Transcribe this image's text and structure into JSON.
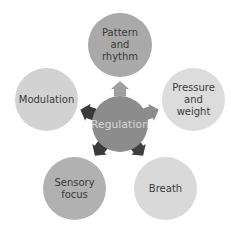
{
  "diagram": {
    "type": "radial-cycle",
    "center": {
      "label": "Regulation",
      "color": "#8c8c8c",
      "text_color": "#d8d8d8"
    },
    "nodes": [
      {
        "id": "pattern",
        "label": "Pattern and\nrhythm",
        "color": "#a9a9a9"
      },
      {
        "id": "pressure",
        "label": "Pressure\nand\nweight",
        "color": "#dcdcdc"
      },
      {
        "id": "breath",
        "label": "Breath",
        "color": "#d9d9d9"
      },
      {
        "id": "sensory",
        "label": "Sensory\nfocus",
        "color": "#b1b1b1"
      },
      {
        "id": "modulation",
        "label": "Modulation",
        "color": "#d2d2d2"
      }
    ],
    "arrows": [
      {
        "to": "pattern",
        "color": "#a0a0a0"
      },
      {
        "to": "pressure",
        "color": "#8c8c8c"
      },
      {
        "to": "breath",
        "color": "#3f3f3f"
      },
      {
        "to": "sensory",
        "color": "#3a3a3a"
      },
      {
        "to": "modulation",
        "color": "#3a3a3a"
      }
    ]
  }
}
